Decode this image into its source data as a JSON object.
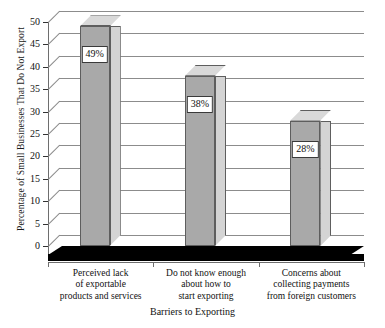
{
  "chart_data": {
    "type": "bar",
    "title": "",
    "xlabel": "Barriers to Exporting",
    "ylabel": "Percentage of Small Businesses That Do Not Export",
    "categories": [
      "Perceived lack of exportable products and services",
      "Do not know enough about how to start exporting",
      "Concerns about collecting payments from foreign customers"
    ],
    "category_lines": [
      [
        "Perceived lack",
        "of exportable",
        "products and services"
      ],
      [
        "Do not know enough",
        "about how to",
        "start exporting"
      ],
      [
        "Concerns about",
        "collecting payments",
        "from foreign customers"
      ]
    ],
    "values": [
      49,
      38,
      28
    ],
    "data_labels": [
      "49%",
      "38%",
      "28%"
    ],
    "ylim": [
      0,
      50
    ],
    "yticks": [
      0,
      5,
      10,
      15,
      20,
      25,
      30,
      35,
      40,
      45,
      50
    ],
    "ytick_labels": [
      "0",
      "5",
      "10",
      "15",
      "20",
      "25",
      "30",
      "35",
      "40",
      "45",
      "50"
    ],
    "grid": true,
    "legend": false,
    "style": "3d-perspective",
    "colors": {
      "bar_front": "#a9a9a9",
      "bar_side": "#d4d4d4",
      "bar_top": "#d9d9d9",
      "bar_outline": "#5e5e5e",
      "gridline": "#8c8c8c",
      "floor": "#000000",
      "background": "#ffffff",
      "text": "#111111"
    }
  }
}
